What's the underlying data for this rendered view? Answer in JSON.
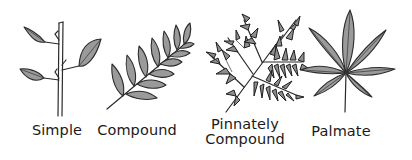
{
  "figure": {
    "items": [
      {
        "id": "simple",
        "label": "Simple",
        "icon": "simple-leaf-illustration"
      },
      {
        "id": "compound",
        "label": "Compound",
        "icon": "compound-leaf-illustration"
      },
      {
        "id": "pinnately-compound",
        "label_line1": "Pinnately",
        "label_line2": "Compound",
        "icon": "pinnately-compound-leaf-illustration"
      },
      {
        "id": "palmate",
        "label": "Palmate",
        "icon": "palmate-leaf-illustration"
      }
    ],
    "colors": {
      "background": "#ffffff",
      "leaf_fill": "#9a9a9a",
      "outline": "#2a2a2a",
      "text": "#1a1a1a"
    }
  }
}
